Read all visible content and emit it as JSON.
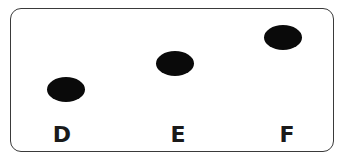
{
  "diagram": {
    "points": [
      {
        "label": "D",
        "cx": 66,
        "cy": 89
      },
      {
        "label": "E",
        "cx": 175,
        "cy": 63
      },
      {
        "label": "F",
        "cx": 283,
        "cy": 38
      }
    ],
    "colors": {
      "dot": "#0a0a0a",
      "border": "#3a3a3a",
      "text": "#1a1a1a"
    }
  }
}
